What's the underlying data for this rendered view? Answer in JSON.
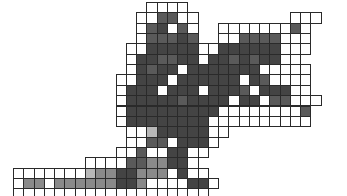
{
  "artwork": {
    "description": "Grayscale pixel-grid shape drawn on graph-paper cells",
    "origin_x": 13,
    "origin_y": 2,
    "cell_w": 10.25,
    "cell_h": 10.35,
    "colors": {
      "w": "#ffffff",
      "l": "#b8b8b8",
      "m": "#8a8a8a",
      "d": "#5a5a5a",
      "k": "#444444",
      "grid_line": "#2a2a2a"
    },
    "rows": [
      ".............wwww..............",
      "............wwddww.........www.",
      "............wdkwdw..wwwwwwwdw..",
      "............wdddkd..wwddddwww..",
      "...........wwkkkkkwwkkkkkkwww..",
      "...........wkkddkkwkkdkdkkww...",
      "...........wkdkkwkkkkkkkwwwww..",
      "..........wwkkkwkkkkkkwkdwwww..",
      "..........wkkkwkkkwkkkdwkkkww..",
      "..........wkkkkkdkkkkwkkwddwww.",
      "..........wkkkkkkkkkwwwwwwwwd..",
      "..........wkkkkkkkkwwwwwwwwww..",
      "...........wwlkkkkkww..........",
      "...........wwddwkkkw...........",
      "..........wwdwwkkww............",
      ".......wwwwddmmkkw.............",
      "wwwwwwwlmmkkmmmwkww............",
      "wmmwmmmmmmkkmwwwwkkw...........",
      "wwwwwwwwwwwwwwwwwww............"
    ]
  }
}
